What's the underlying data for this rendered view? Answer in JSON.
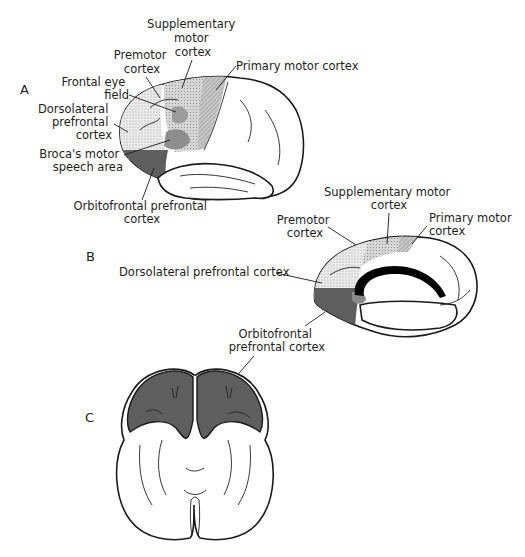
{
  "figure": {
    "colors": {
      "orbitofrontal": "#5e5e5e",
      "broca": "#8a8a8a",
      "frontal_eye_field": "#9a9a9a",
      "dorsolateral": "#e4e4e4",
      "premotor": "#d2d2d2",
      "primary_motor": "#bdbdbd",
      "supplementary": "#cfcfcf",
      "corpus_callosum": "#000000"
    },
    "panels": [
      {
        "id": "A",
        "letter": "A",
        "view": "lateral",
        "labels": {
          "supplementary": [
            "Supplementary",
            "motor",
            "cortex"
          ],
          "premotor": [
            "Premotor",
            "cortex"
          ],
          "primary_motor": [
            "Primary motor cortex"
          ],
          "frontal_eye_field": [
            "Frontal eye",
            "field"
          ],
          "dorsolateral": [
            "Dorsolateral",
            "prefrontal",
            "cortex"
          ],
          "broca": [
            "Broca's motor",
            "speech area"
          ],
          "orbitofrontal": [
            "Orbitofrontal prefrontal",
            "cortex"
          ]
        }
      },
      {
        "id": "B",
        "letter": "B",
        "view": "medial",
        "labels": {
          "supplementary": [
            "Supplementary motor",
            "cortex"
          ],
          "premotor": [
            "Premotor",
            "cortex"
          ],
          "primary_motor": [
            "Primary motor",
            "cortex"
          ],
          "dorsolateral": [
            "Dorsolateral prefrontal cortex"
          ],
          "orbitofrontal": [
            "Orbitofrontal",
            "prefrontal cortex"
          ]
        }
      },
      {
        "id": "C",
        "letter": "C",
        "view": "ventral",
        "labels": {}
      }
    ]
  }
}
